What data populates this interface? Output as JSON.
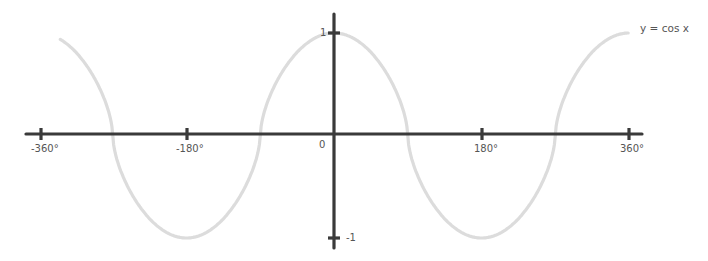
{
  "chart_data": {
    "type": "line",
    "title": "",
    "xlabel": "",
    "ylabel": "",
    "function": "y = cos x",
    "x_unit": "degrees",
    "xlim": [
      -330,
      360
    ],
    "ylim": [
      -1,
      1
    ],
    "grid": false,
    "legend_position": "top-right (inline label at curve end)",
    "x_ticks": [
      -360,
      -180,
      0,
      180,
      360
    ],
    "x_tick_labels": [
      "-360°",
      "-180°",
      "0",
      "180°",
      "360°"
    ],
    "y_ticks": [
      1,
      -1
    ],
    "y_tick_labels": [
      "1",
      "-1"
    ],
    "series": [
      {
        "name": "y = cos x",
        "color": "#dcdcdc",
        "x": [
          -330,
          -270,
          -180,
          -90,
          0,
          90,
          180,
          270,
          360
        ],
        "values": [
          0.87,
          0,
          -1,
          0,
          1,
          0,
          -1,
          0,
          1
        ]
      }
    ]
  },
  "labels": {
    "x_neg360": "-360°",
    "x_neg180": "-180°",
    "origin": "0",
    "x_180": "180°",
    "x_360": "360°",
    "y_1": "1",
    "y_neg1": "-1",
    "legend": "y = cos x"
  },
  "colors": {
    "axis": "#3a3a3a",
    "curve": "#dcdcdc",
    "text": "#555555"
  }
}
